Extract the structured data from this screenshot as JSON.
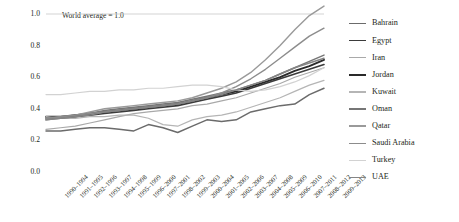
{
  "chart_data": {
    "type": "line",
    "title": "",
    "xlabel": "",
    "ylabel": "Citation impact relative to world",
    "ylim": [
      0.0,
      1.0
    ],
    "yticks": [
      "0.0",
      "0.2",
      "0.4",
      "0.6",
      "0.8",
      "1.0"
    ],
    "ytick_values": [
      0.0,
      0.2,
      0.4,
      0.6,
      0.8,
      1.0
    ],
    "grid": false,
    "legend_position": "right",
    "annotations": [
      {
        "text": "World average = 1.0",
        "value": 1.0,
        "type": "reference-line-label"
      }
    ],
    "reference_line": {
      "value": 1.0,
      "color": "#c8c8c8"
    },
    "categories": [
      "1990–1994",
      "1991–1995",
      "1992–1996",
      "1993–1997",
      "1994–1998",
      "1995–1999",
      "1996–2000",
      "1997–2001",
      "1998–2002",
      "1999–2003",
      "2000–2004",
      "2001–2005",
      "2002–2006",
      "2003–2007",
      "2004–2008",
      "2005–2009",
      "2006–2010",
      "2007–2011",
      "2008–2012",
      "2009–2013"
    ],
    "series": [
      {
        "name": "Bahrain",
        "color": "#6b6b6b",
        "width": 1.5,
        "values": [
          0.26,
          0.26,
          0.27,
          0.28,
          0.28,
          0.27,
          0.26,
          0.3,
          0.28,
          0.25,
          0.29,
          0.33,
          0.32,
          0.33,
          0.38,
          0.4,
          0.42,
          0.43,
          0.49,
          0.53
        ]
      },
      {
        "name": "Egypt",
        "color": "#3b3b3b",
        "width": 1.6,
        "values": [
          0.34,
          0.34,
          0.35,
          0.36,
          0.37,
          0.38,
          0.39,
          0.4,
          0.41,
          0.42,
          0.44,
          0.46,
          0.48,
          0.5,
          0.53,
          0.56,
          0.59,
          0.62,
          0.65,
          0.68
        ]
      },
      {
        "name": "Iran",
        "color": "#a9a9a9",
        "width": 1.2,
        "values": [
          0.27,
          0.28,
          0.29,
          0.31,
          0.33,
          0.35,
          0.37,
          0.38,
          0.39,
          0.4,
          0.42,
          0.43,
          0.45,
          0.47,
          0.5,
          0.53,
          0.56,
          0.6,
          0.63,
          0.66
        ]
      },
      {
        "name": "Jordan",
        "color": "#2a2a2a",
        "width": 1.9,
        "values": [
          0.35,
          0.35,
          0.36,
          0.37,
          0.38,
          0.39,
          0.4,
          0.41,
          0.42,
          0.43,
          0.45,
          0.47,
          0.49,
          0.51,
          0.54,
          0.57,
          0.6,
          0.64,
          0.67,
          0.71
        ]
      },
      {
        "name": "Kuwait",
        "color": "#b5b5b5",
        "width": 1.2,
        "values": [
          0.35,
          0.34,
          0.34,
          0.35,
          0.35,
          0.36,
          0.36,
          0.34,
          0.3,
          0.29,
          0.33,
          0.35,
          0.36,
          0.38,
          0.41,
          0.44,
          0.47,
          0.51,
          0.55,
          0.58
        ]
      },
      {
        "name": "Oman",
        "color": "#767676",
        "width": 1.5,
        "values": [
          0.33,
          0.34,
          0.35,
          0.37,
          0.39,
          0.4,
          0.41,
          0.42,
          0.43,
          0.44,
          0.46,
          0.48,
          0.5,
          0.52,
          0.55,
          0.58,
          0.62,
          0.66,
          0.7,
          0.74
        ]
      },
      {
        "name": "Qatar",
        "color": "#9a9a9a",
        "width": 1.4,
        "values": [
          0.34,
          0.35,
          0.36,
          0.38,
          0.4,
          0.41,
          0.42,
          0.43,
          0.44,
          0.45,
          0.47,
          0.5,
          0.53,
          0.57,
          0.63,
          0.71,
          0.8,
          0.9,
          0.99,
          1.05
        ]
      },
      {
        "name": "Saudi Arabia",
        "color": "#8c8c8c",
        "width": 1.4,
        "values": [
          0.34,
          0.35,
          0.36,
          0.37,
          0.38,
          0.39,
          0.4,
          0.41,
          0.42,
          0.43,
          0.45,
          0.47,
          0.5,
          0.54,
          0.59,
          0.65,
          0.72,
          0.79,
          0.86,
          0.91
        ]
      },
      {
        "name": "Turkey",
        "color": "#d2d2d2",
        "width": 1.2,
        "values": [
          0.49,
          0.49,
          0.5,
          0.51,
          0.51,
          0.52,
          0.52,
          0.53,
          0.53,
          0.54,
          0.55,
          0.55,
          0.54,
          0.52,
          0.51,
          0.52,
          0.54,
          0.57,
          0.61,
          0.66
        ]
      },
      {
        "name": "UAE",
        "color": "#858585",
        "width": 1.5,
        "values": [
          0.33,
          0.34,
          0.35,
          0.36,
          0.38,
          0.39,
          0.4,
          0.41,
          0.42,
          0.43,
          0.45,
          0.47,
          0.49,
          0.52,
          0.55,
          0.58,
          0.62,
          0.66,
          0.69,
          0.72
        ]
      }
    ]
  },
  "legend": {
    "items": [
      {
        "label": "Bahrain"
      },
      {
        "label": "Egypt"
      },
      {
        "label": "Iran"
      },
      {
        "label": "Jordan"
      },
      {
        "label": "Kuwait"
      },
      {
        "label": "Oman"
      },
      {
        "label": "Qatar"
      },
      {
        "label": "Saudi Arabia"
      },
      {
        "label": "Turkey"
      },
      {
        "label": "UAE"
      }
    ]
  }
}
